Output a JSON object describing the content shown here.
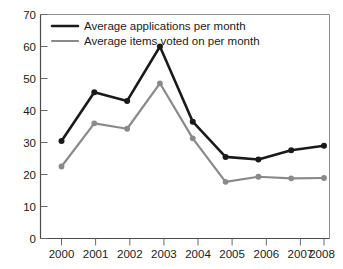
{
  "chart_data": {
    "type": "line",
    "title": "",
    "xlabel": "",
    "ylabel": "",
    "categories": [
      "2000",
      "2001",
      "2002",
      "2003",
      "2004",
      "2005",
      "2006",
      "2007",
      "2008"
    ],
    "x": [
      2000,
      2001,
      2002,
      2003,
      2004,
      2005,
      2006,
      2007,
      2008
    ],
    "ylim": [
      0,
      70
    ],
    "yticks": [
      0,
      10,
      20,
      30,
      40,
      50,
      60,
      70
    ],
    "ytick_labels": [
      "0",
      "10",
      "20",
      "30",
      "40",
      "50",
      "60",
      "70"
    ],
    "grid": false,
    "legend_position": "top-left-inside",
    "series": [
      {
        "name": "Average applications per month",
        "color": "#1a1a1a",
        "marker": "circle",
        "values": [
          30.5,
          45.7,
          43.0,
          60.0,
          36.5,
          25.5,
          24.7,
          27.6,
          29.0
        ]
      },
      {
        "name": "Average items voted on per month",
        "color": "#8a8a8a",
        "marker": "circle",
        "values": [
          22.5,
          36.0,
          34.3,
          48.5,
          31.3,
          17.7,
          19.3,
          18.8,
          18.9
        ]
      }
    ]
  },
  "legend": {
    "items": [
      {
        "label": "Average applications per month",
        "color": "#1a1a1a"
      },
      {
        "label": "Average items voted on per month",
        "color": "#8a8a8a"
      }
    ]
  },
  "axes": {
    "y_tick_labels": [
      "70",
      "60",
      "50",
      "40",
      "30",
      "20",
      "10",
      "0"
    ],
    "x_tick_labels": [
      "2000",
      "2001",
      "2002",
      "2003",
      "2004",
      "2005",
      "2006",
      "2007",
      "2008"
    ]
  }
}
